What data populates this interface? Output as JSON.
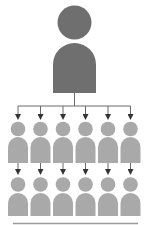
{
  "diagram": {
    "type": "org-hierarchy",
    "leader": {
      "label": "leader-person-icon",
      "color": "#6f6f6f"
    },
    "members": {
      "color": "#a9a9a9",
      "columns": 6,
      "rows": 2
    },
    "connector_color": "#6a6a6a",
    "baseline_color": "#9a9a9a"
  }
}
